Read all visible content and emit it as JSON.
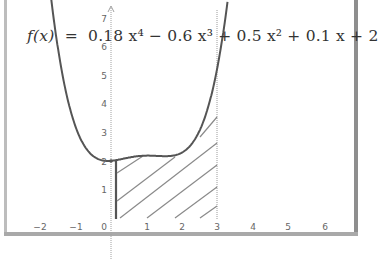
{
  "chart_data": {
    "type": "line",
    "formula": {
      "lhs": "f(x)",
      "eq": "=",
      "rhs": "0.18 x⁴ − 0.6 x³ + 0.5 x² + 0.1 x + 2"
    },
    "coefficients": [
      0.18,
      -0.6,
      0.5,
      0.1,
      2
    ],
    "xlabel": "",
    "ylabel": "",
    "xlim": [
      -2.3,
      6.8
    ],
    "ylim": [
      0,
      7.6
    ],
    "x_ticks": [
      "−2",
      "−1",
      "0",
      "1",
      "2",
      "3",
      "4",
      "5",
      "6"
    ],
    "y_ticks": [
      "1",
      "2",
      "3",
      "4",
      "5",
      "6",
      "7"
    ],
    "grid": false,
    "series": [
      {
        "name": "f(x)",
        "x": [
          -1.68,
          -1.5,
          -1.0,
          -0.5,
          0,
          0.5,
          1.0,
          1.5,
          2.0,
          2.5,
          3.0,
          3.2,
          3.3
        ],
        "y": [
          7.6,
          5.91,
          3.18,
          2.16,
          2.0,
          2.11,
          2.18,
          2.16,
          2.28,
          3.03,
          5.18,
          6.65,
          7.56
        ]
      }
    ],
    "shaded_region": {
      "style": "hatched",
      "x_from": 0,
      "x_to": 3,
      "description": "Area under f(x) from x=0 to x=3"
    },
    "vertical_lines": [
      0,
      3
    ]
  },
  "colors": {
    "curve": "#555555",
    "axis": "#9a9a9a",
    "hatch": "#8a8a8a",
    "text": "#333333"
  }
}
